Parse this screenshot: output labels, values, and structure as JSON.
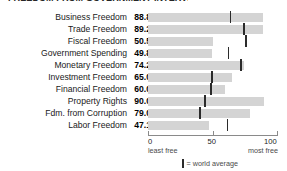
{
  "title": "FREEDOM FROM GOVERNMENT INTERVENTION",
  "chart_data": {
    "type": "bar",
    "title": "",
    "xlabel": "",
    "ylabel": "",
    "xlim": [
      0,
      100
    ],
    "grid": false,
    "orientation": "horizontal",
    "categories": [
      "Business Freedom",
      "Trade Freedom",
      "Fiscal Freedom",
      "Government Spending",
      "Monetary Freedom",
      "Investment Freedom",
      "Financial Freedom",
      "Property Rights",
      "Fdm. from Corruption",
      "Labor Freedom"
    ],
    "values": [
      88.8,
      89.2,
      50.5,
      49.8,
      74.2,
      65.0,
      60.0,
      90.0,
      79.0,
      47.1
    ],
    "value_labels": [
      "88.8",
      "89.2",
      "50.5",
      "49.8",
      "74.2",
      "65.0",
      "60.0",
      "90.0",
      "79.0",
      "47.1"
    ],
    "trends": [
      "up",
      "up",
      "up",
      "down",
      "down",
      "up",
      "flat",
      "flat",
      "down",
      "down"
    ],
    "trend_glyphs": [
      "▲",
      "▲",
      "▲",
      "▽",
      "▽",
      "▲",
      "—",
      "—",
      "▽",
      "▽"
    ],
    "world_average": [
      64.0,
      74.5,
      76.0,
      62.5,
      72.0,
      49.5,
      49.0,
      44.0,
      40.5,
      61.5
    ],
    "series": [
      {
        "name": "score",
        "values": [
          88.8,
          89.2,
          50.5,
          49.8,
          74.2,
          65.0,
          60.0,
          90.0,
          79.0,
          47.1
        ]
      },
      {
        "name": "world average",
        "values": [
          64.0,
          74.5,
          76.0,
          62.5,
          72.0,
          49.5,
          49.0,
          44.0,
          40.5,
          61.5
        ]
      }
    ],
    "ticks": [
      0,
      50,
      100
    ],
    "tick_labels": [
      "0",
      "50",
      "100"
    ],
    "axis_caption_left": "least free",
    "axis_caption_right": "most free",
    "legend": {
      "position": "bottom",
      "marker": "▌",
      "label": "= world average"
    },
    "colors": {
      "bar": "#d4d4d4",
      "average_marker": "#2b2b2b",
      "axis": "#8a8a8a",
      "text": "#1a1a1a"
    }
  }
}
